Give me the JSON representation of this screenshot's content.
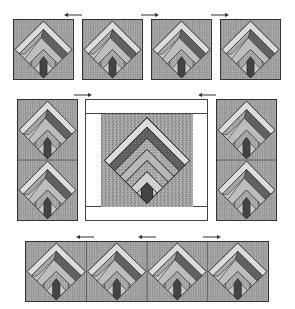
{
  "diagram": {
    "block_name": "log-cabin arrow block (on point)",
    "colors": {
      "background_speckle": "#9a9a9a",
      "outline": "#2a2a2a",
      "light_strip": "#d8d8d8",
      "mid_strip": "#b4b4b4",
      "dark_strip": "#5c5c5c",
      "arrow_stem": "#444444",
      "border_white": "#ffffff"
    },
    "top_row": {
      "blocks": 4,
      "arrows": [
        {
          "x": 73,
          "direction": "left"
        },
        {
          "x": 150,
          "direction": "right"
        },
        {
          "x": 220,
          "direction": "right"
        }
      ]
    },
    "middle_row": {
      "left_column_blocks": 2,
      "center_panel": {
        "inner_blocks": 1,
        "border": "white strips"
      },
      "right_column_blocks": 2,
      "arrows": [
        {
          "x": 83,
          "direction": "right"
        },
        {
          "x": 205,
          "direction": "left"
        }
      ]
    },
    "bottom_row": {
      "blocks": 4,
      "arrows": [
        {
          "x": 80,
          "direction": "left"
        },
        {
          "x": 140,
          "direction": "left"
        },
        {
          "x": 210,
          "direction": "right"
        }
      ]
    }
  }
}
